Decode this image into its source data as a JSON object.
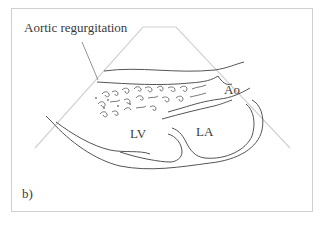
{
  "figure": {
    "panel_label": "b)",
    "annotation": "Aortic regurgitation",
    "structures": {
      "aorta": "Ao",
      "left_ventricle": "LV",
      "left_atrium": "LA"
    }
  },
  "colors": {
    "frame": "#cfcfcf",
    "sector": "#d2d2d2",
    "outline": "#555555",
    "text": "#3a3a3a"
  }
}
